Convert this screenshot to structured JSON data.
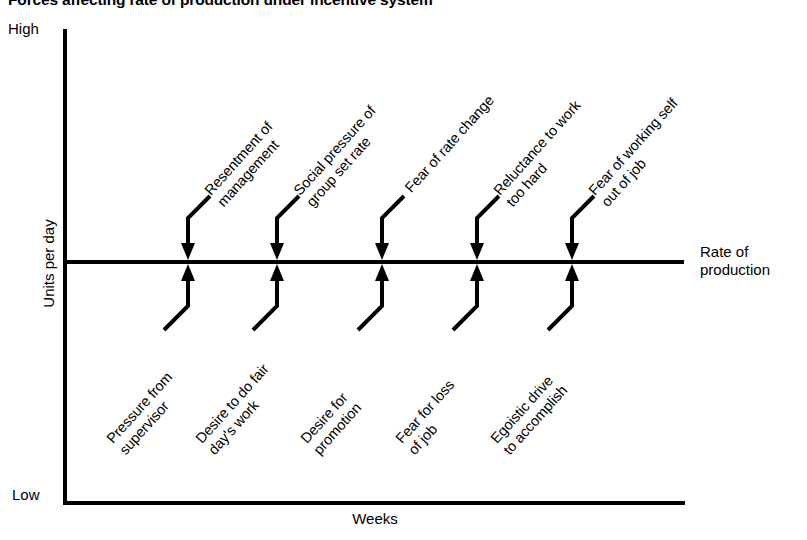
{
  "title": "Forces affecting rate of production under incentive system",
  "axes": {
    "y_label": "Units per day",
    "y_high": "High",
    "y_low": "Low",
    "x_label": "Weeks",
    "rate_line_label_line1": "Rate of",
    "rate_line_label_line2": "production"
  },
  "chart_data": {
    "type": "diagram",
    "title": "Forces affecting rate of production under incentive system",
    "xlabel": "Weeks",
    "ylabel": "Units per day",
    "ylim": [
      "Low",
      "High"
    ],
    "grid": false,
    "legend": false,
    "reference_line": {
      "label": "Rate of production",
      "orientation": "horizontal",
      "y_value": "current rate of production"
    },
    "columns": [
      {
        "index": 1,
        "x_px": 188,
        "restraining_force": {
          "line1": "Resentment of",
          "line2": "management",
          "direction": "down"
        },
        "driving_force": {
          "line1": "Pressure from",
          "line2": "supervisor",
          "direction": "up"
        }
      },
      {
        "index": 2,
        "x_px": 277,
        "restraining_force": {
          "line1": "Social pressure of",
          "line2": "group set rate",
          "direction": "down"
        },
        "driving_force": {
          "line1": "Desire to do fair",
          "line2": "day's work",
          "direction": "up"
        }
      },
      {
        "index": 3,
        "x_px": 382,
        "restraining_force": {
          "line1": "Fear of rate change",
          "line2": "",
          "direction": "down"
        },
        "driving_force": {
          "line1": "Desire for",
          "line2": "promotion",
          "direction": "up"
        }
      },
      {
        "index": 4,
        "x_px": 477,
        "restraining_force": {
          "line1": "Reluctance to work",
          "line2": "too hard",
          "direction": "down"
        },
        "driving_force": {
          "line1": "Fear for loss",
          "line2": "of job",
          "direction": "up"
        }
      },
      {
        "index": 5,
        "x_px": 572,
        "restraining_force": {
          "line1": "Fear of working self",
          "line2": "out of job",
          "direction": "down"
        },
        "driving_force": {
          "line1": "Egoistic drive",
          "line2": "to accomplish",
          "direction": "up"
        }
      }
    ]
  }
}
